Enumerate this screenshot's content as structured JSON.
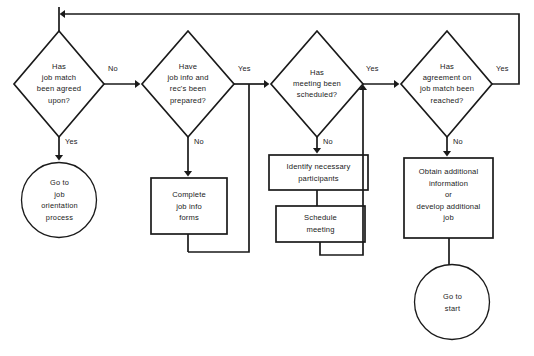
{
  "diagram": {
    "stroke_color": "#1a1a1a",
    "background_color": "#ffffff",
    "decisions": [
      {
        "id": "has-job-match-been-agreed-upon",
        "text": "Has\njob match\nbeen agreed\nupon?",
        "yes_label": "Yes",
        "no_label": "No"
      },
      {
        "id": "have-job-info-and-recs-been-prepared",
        "text": "Have\njob info and\nrec's been\nprepared?",
        "yes_label": "Yes",
        "no_label": "No"
      },
      {
        "id": "has-meeting-been-scheduled",
        "text": "Has\nmeeting been\nscheduled?",
        "yes_label": "Yes",
        "no_label": "No"
      },
      {
        "id": "has-agreement-on-job-match-been-reached",
        "text": "Has\nagreement on\njob match been\nreached?",
        "yes_label": "Yes",
        "no_label": "No"
      }
    ],
    "processes": [
      {
        "id": "complete-job-info-forms",
        "text": "Complete\njob info\nforms"
      },
      {
        "id": "identify-necessary-participants",
        "text": "Identify necessary\nparticipants"
      },
      {
        "id": "schedule-meeting",
        "text": "Schedule\nmeeting"
      },
      {
        "id": "obtain-additional-information",
        "text": "Obtain additional\ninformation\nor\ndevelop additional\njob"
      }
    ],
    "terminators": [
      {
        "id": "go-to-job-orientation-process",
        "text": "Go to\njob\norientation\nprocess"
      },
      {
        "id": "go-to-start",
        "text": "Go to\nstart"
      }
    ]
  }
}
